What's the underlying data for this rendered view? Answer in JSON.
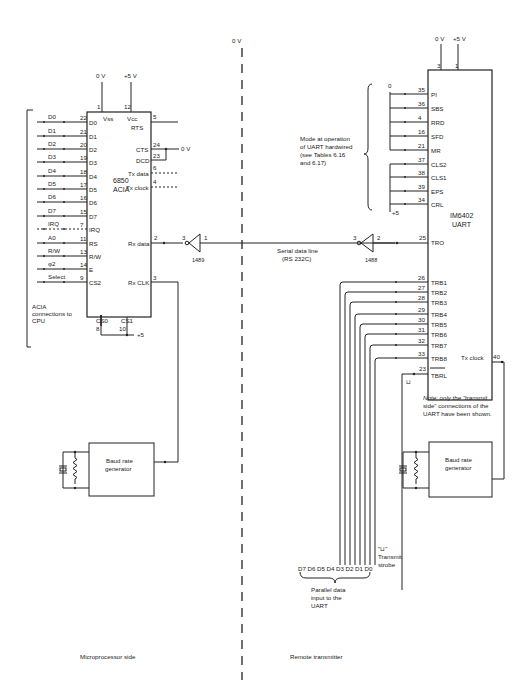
{
  "divider": {
    "label": "0 V"
  },
  "acia": {
    "name": "6850",
    "subtitle": "ACIA",
    "supply": {
      "vss_label": "0 V",
      "vcc_label": "+5 V",
      "vss_pin": "1",
      "vcc_pin": "12",
      "vss_name": "Vss",
      "vcc_name": "Vcc"
    },
    "left_pins": [
      {
        "signal": "D0",
        "pin": "22",
        "name": "D0"
      },
      {
        "signal": "D1",
        "pin": "21",
        "name": "D1"
      },
      {
        "signal": "D2",
        "pin": "20",
        "name": "D2"
      },
      {
        "signal": "D3",
        "pin": "19",
        "name": "D3"
      },
      {
        "signal": "D4",
        "pin": "18",
        "name": "D4"
      },
      {
        "signal": "D5",
        "pin": "17",
        "name": "D5"
      },
      {
        "signal": "D6",
        "pin": "16",
        "name": "D6"
      },
      {
        "signal": "D7",
        "pin": "15",
        "name": "D7"
      },
      {
        "signal": "IRQ",
        "pin": "7",
        "name": "IRQ"
      },
      {
        "signal": "A0",
        "pin": "11",
        "name": "RS"
      },
      {
        "signal": "R/W",
        "pin": "13",
        "name": "R/W"
      },
      {
        "signal": "φ2",
        "pin": "14",
        "name": "E"
      },
      {
        "signal": "Select",
        "pin": "9",
        "name": "CS2"
      }
    ],
    "right_pins": [
      {
        "name": "RTS",
        "pin": "5"
      },
      {
        "name": "CTS",
        "pin": "24"
      },
      {
        "name": "DCD",
        "pin": "23"
      },
      {
        "name": "Tx data",
        "pin": "6"
      },
      {
        "name": "Tx clock",
        "pin": "4"
      },
      {
        "name": "Rx data",
        "pin": "2"
      },
      {
        "name": "Rx CLK",
        "pin": "3"
      }
    ],
    "cts_tie_label": "0 V",
    "bottom_pins": [
      {
        "name": "CS0",
        "pin": "8"
      },
      {
        "name": "CS1",
        "pin": "10"
      }
    ],
    "cs_tie_label": "+5",
    "bracket_label": [
      "ACIA",
      "connections to",
      "CPU"
    ]
  },
  "receiver": {
    "part": "1489",
    "pin_in": "1",
    "pin_out": "3"
  },
  "line": {
    "label_1": "Serial data line",
    "label_2": "(RS 232C)"
  },
  "driver": {
    "part": "1488",
    "pin_in": "2",
    "pin_out": "3"
  },
  "uart": {
    "name": "IM6402",
    "subtitle": "UART",
    "supply": {
      "gnd_label": "0 V",
      "vcc_label": "+5 V",
      "gnd_pin": "3",
      "vcc_pin": "1"
    },
    "mode_pins": [
      {
        "pin": "35",
        "name": "PI"
      },
      {
        "pin": "36",
        "name": "SBS"
      },
      {
        "pin": "4",
        "name": "RRD"
      },
      {
        "pin": "16",
        "name": "SFD"
      },
      {
        "pin": "21",
        "name": "MR"
      },
      {
        "pin": "37",
        "name": "CLS2"
      },
      {
        "pin": "38",
        "name": "CLS1"
      },
      {
        "pin": "39",
        "name": "EPS"
      },
      {
        "pin": "34",
        "name": "CRL"
      }
    ],
    "mode_low_label": "0",
    "mode_high_label": "+5",
    "mode_note": [
      "Mode at operation",
      "of UART hardwired",
      "(see Tables 6.16",
      "and 6.17)"
    ],
    "tro": {
      "pin": "25",
      "name": "TRO"
    },
    "trb_pins": [
      {
        "pin": "26",
        "name": "TRB1"
      },
      {
        "pin": "27",
        "name": "TRB2"
      },
      {
        "pin": "28",
        "name": "TRB3"
      },
      {
        "pin": "29",
        "name": "TRB4"
      },
      {
        "pin": "30",
        "name": "TRB5"
      },
      {
        "pin": "31",
        "name": "TRB6"
      },
      {
        "pin": "32",
        "name": "TRB7"
      },
      {
        "pin": "33",
        "name": "TRB8"
      }
    ],
    "tbrl": {
      "pin": "23",
      "name": "TBRL"
    },
    "tx_clock": {
      "pin": "40",
      "name": "Tx clock"
    },
    "note": [
      "Note: only the \"transmit",
      "side\" connections of the",
      "UART have been shown."
    ]
  },
  "baud_left": {
    "line1": "Baud rate",
    "line2": "generator"
  },
  "baud_right": {
    "line1": "Baud rate",
    "line2": "generator"
  },
  "parallel": {
    "bits": [
      "D7",
      "D6",
      "D5",
      "D4",
      "D3",
      "D2",
      "D1",
      "D0"
    ],
    "label": [
      "Parallel data",
      "input to the",
      "UART"
    ],
    "strobe_symbol": "\"⊔\"",
    "strobe_label": [
      "Transmit",
      "strobe"
    ],
    "pulse_symbol": "⊔"
  },
  "footer": {
    "left": "Microprocessor side",
    "right": "Remote transmitter"
  }
}
